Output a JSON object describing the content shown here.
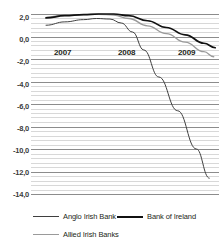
{
  "chart_data": {
    "type": "line",
    "title": "",
    "subtitle": "",
    "xlabel": "",
    "ylabel": "",
    "xlim": [
      2006.75,
      2009.25
    ],
    "ylim": [
      -14.0,
      2.0
    ],
    "grid": true,
    "legend_position": "bottom-left",
    "y_tick_labels": [
      "2,0",
      "0,0",
      "-2,0",
      "-4,0",
      "-6,0",
      "-8,0",
      "-10,0",
      "-12,0",
      "-14,0"
    ],
    "y_tick_values": [
      2.0,
      0.0,
      -2.0,
      -4.0,
      -6.0,
      -8.0,
      -10.0,
      -12.0,
      -14.0
    ],
    "x_tick_labels": [
      "2007",
      "2008",
      "2009"
    ],
    "x_tick_values": [
      2007,
      2008,
      2009
    ],
    "series": [
      {
        "name": "Anglo Irish Bank",
        "color": "#3f3f3f",
        "width": 1.0,
        "x": [
          2006.95,
          2007.2,
          2007.45,
          2007.62,
          2007.8,
          2007.95,
          2008.1,
          2008.25,
          2008.45,
          2008.7,
          2008.95,
          2009.12
        ],
        "y": [
          1.0,
          1.3,
          1.5,
          1.6,
          1.55,
          1.2,
          0.4,
          -1.2,
          -3.6,
          -6.6,
          -10.0,
          -12.6
        ]
      },
      {
        "name": "Bank of Ireland",
        "color": "#111111",
        "width": 1.7,
        "x": [
          2006.95,
          2007.2,
          2007.45,
          2007.65,
          2007.85,
          2008.05,
          2008.3,
          2008.55,
          2008.8,
          2009.05,
          2009.2
        ],
        "y": [
          1.65,
          1.85,
          1.95,
          2.0,
          2.0,
          1.85,
          1.4,
          0.8,
          0.15,
          -0.6,
          -1.0
        ]
      },
      {
        "name": "Allied Irish Banks",
        "color": "#9a9a9a",
        "width": 1.3,
        "x": [
          2006.95,
          2007.2,
          2007.45,
          2007.65,
          2007.85,
          2008.05,
          2008.3,
          2008.55,
          2008.8,
          2009.05,
          2009.18
        ],
        "y": [
          1.7,
          1.9,
          1.95,
          1.98,
          1.9,
          1.6,
          0.95,
          0.25,
          -0.5,
          -1.35,
          -1.8
        ]
      }
    ]
  },
  "y_axis": {
    "ticks": [
      {
        "label": "2,0",
        "top": 14
      },
      {
        "label": "0,0",
        "top": 36
      },
      {
        "label": "-2,0",
        "top": 58
      },
      {
        "label": "-4,0",
        "top": 81
      },
      {
        "label": "-6,0",
        "top": 103
      },
      {
        "label": "-8,0",
        "top": 125
      },
      {
        "label": "-10,0",
        "top": 147
      },
      {
        "label": "-12,0",
        "top": 169
      },
      {
        "label": "-14,0",
        "top": 191
      }
    ]
  },
  "x_axis": {
    "ticks": [
      {
        "label": "2007",
        "left": 23
      },
      {
        "label": "2008",
        "left": 87
      },
      {
        "label": "2009",
        "left": 147
      }
    ]
  },
  "legend": {
    "items": [
      {
        "label": "Anglo Irish Bank",
        "color": "#3f3f3f",
        "thickness": "1px"
      },
      {
        "label": "Bank of Ireland",
        "color": "#111111",
        "thickness": "2px"
      },
      {
        "label": "Allied Irish Banks",
        "color": "#9a9a9a",
        "thickness": "1.5px"
      }
    ]
  }
}
